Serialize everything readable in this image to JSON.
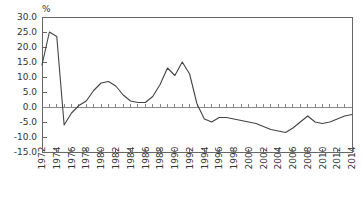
{
  "chart_data": {
    "type": "line",
    "title": "",
    "subtitle": "",
    "xlabel": "",
    "ylabel": "%",
    "unit_label": "%",
    "ylim": [
      -15.0,
      30.0
    ],
    "xlim": [
      1972,
      2014
    ],
    "grid": false,
    "legend": null,
    "legend_position": "none",
    "zero_line": true,
    "y_ticks": [
      30.0,
      25.0,
      20.0,
      15.0,
      10.0,
      5.0,
      0.0,
      -5.0,
      -10.0,
      -15.0
    ],
    "y_tick_labels": [
      "30.0",
      "25.0",
      "20.0",
      "15.0",
      "10.0",
      "5.0",
      "0.0",
      "-5.0",
      "-10.0",
      "-15.0"
    ],
    "x_ticks": [
      1972,
      1974,
      1976,
      1978,
      1980,
      1982,
      1984,
      1986,
      1988,
      1990,
      1992,
      1994,
      1996,
      1998,
      2000,
      2002,
      2004,
      2006,
      2008,
      2010,
      2012,
      2014
    ],
    "x_tick_labels": [
      "1972",
      "1974",
      "1976",
      "1978",
      "1980",
      "1982",
      "1984",
      "1986",
      "1988",
      "1990",
      "1992",
      "1994",
      "1996",
      "1998",
      "2000",
      "2002",
      "2004",
      "2006",
      "2008",
      "2010",
      "2012",
      "2014"
    ],
    "x_minor_step": 1,
    "line_color": "#444444",
    "axis_color": "#666666",
    "x": [
      1972,
      1973,
      1974,
      1975,
      1976,
      1977,
      1978,
      1979,
      1980,
      1981,
      1982,
      1983,
      1984,
      1985,
      1986,
      1987,
      1988,
      1989,
      1990,
      1991,
      1992,
      1993,
      1994,
      1995,
      1996,
      1997,
      1998,
      1999,
      2000,
      2001,
      2002,
      2003,
      2004,
      2005,
      2006,
      2007,
      2008,
      2009,
      2010,
      2011,
      2012,
      2013,
      2014
    ],
    "values": [
      14.0,
      25.0,
      23.5,
      -6.0,
      -2.0,
      0.5,
      2.0,
      5.5,
      8.0,
      8.5,
      7.0,
      4.0,
      2.0,
      1.5,
      1.5,
      3.5,
      7.5,
      13.0,
      10.5,
      15.0,
      11.0,
      1.0,
      -4.0,
      -5.0,
      -3.5,
      -3.5,
      -4.0,
      -4.5,
      -5.0,
      -5.5,
      -6.5,
      -7.5,
      -8.0,
      -8.5,
      -7.0,
      -5.0,
      -3.0,
      -5.0,
      -5.5,
      -5.0,
      -4.0,
      -3.0,
      -2.5
    ],
    "series": [
      {
        "name": "series-1",
        "values": [
          14.0,
          25.0,
          23.5,
          -6.0,
          -2.0,
          0.5,
          2.0,
          5.5,
          8.0,
          8.5,
          7.0,
          4.0,
          2.0,
          1.5,
          1.5,
          3.5,
          7.5,
          13.0,
          10.5,
          15.0,
          11.0,
          1.0,
          -4.0,
          -5.0,
          -3.5,
          -3.5,
          -4.0,
          -4.5,
          -5.0,
          -5.5,
          -6.5,
          -7.5,
          -8.0,
          -8.5,
          -7.0,
          -5.0,
          -3.0,
          -5.0,
          -5.5,
          -5.0,
          -4.0,
          -3.0,
          -2.5
        ]
      }
    ],
    "annotations": []
  },
  "plot_geometry": {
    "left": 42,
    "right": 352,
    "top": 17,
    "bottom": 152
  }
}
